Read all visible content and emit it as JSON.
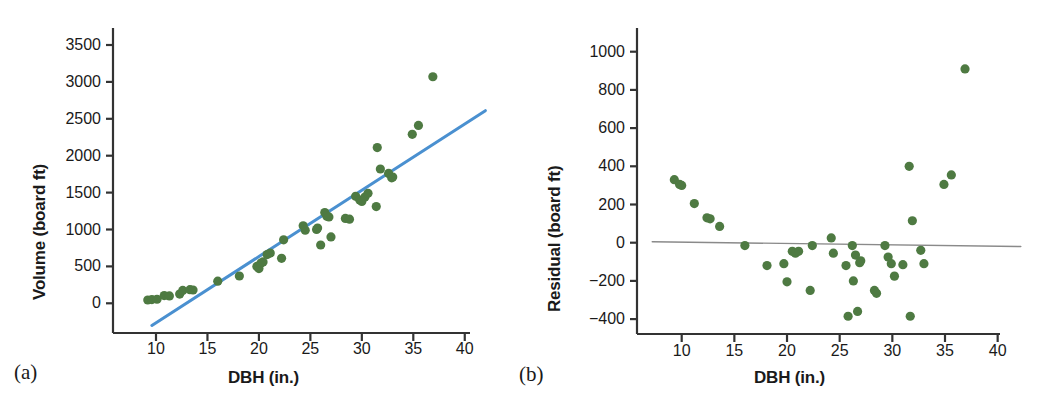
{
  "figure": {
    "panels": [
      {
        "tag": "(a)",
        "xlabel": "DBH (in.)",
        "ylabel": "Volume (board ft)"
      },
      {
        "tag": "(b)",
        "xlabel": "DBH (in.)",
        "ylabel": "Residual (board ft)"
      }
    ],
    "colors": {
      "marker": "#4e7a42",
      "regression_line": "#4a90d0",
      "zero_line": "#8a8a8a",
      "axis": "#333333",
      "text": "#1a1a1a",
      "background": "#ffffff"
    }
  },
  "chart_data": [
    {
      "type": "scatter",
      "panel": "(a)",
      "title": "",
      "xlabel": "DBH (in.)",
      "ylabel": "Volume (board ft)",
      "xlim": [
        7.2,
        42.2
      ],
      "ylim": [
        -330,
        3750
      ],
      "xticks": [
        10,
        15,
        20,
        25,
        30,
        35,
        40
      ],
      "yticks": [
        0,
        500,
        1000,
        1500,
        2000,
        2500,
        3000,
        3500
      ],
      "grid": false,
      "legend": "none",
      "series": [
        {
          "name": "Trees",
          "marker": "circle",
          "color": "#4e7a42",
          "points": [
            [
              9.2,
              45
            ],
            [
              9.6,
              50
            ],
            [
              10.1,
              55
            ],
            [
              10.8,
              105
            ],
            [
              11.3,
              100
            ],
            [
              12.3,
              125
            ],
            [
              12.6,
              175
            ],
            [
              13.3,
              185
            ],
            [
              13.6,
              180
            ],
            [
              16.0,
              300
            ],
            [
              18.1,
              370
            ],
            [
              19.8,
              500
            ],
            [
              20.0,
              470
            ],
            [
              20.2,
              545
            ],
            [
              20.4,
              560
            ],
            [
              20.8,
              660
            ],
            [
              21.1,
              680
            ],
            [
              22.2,
              610
            ],
            [
              22.4,
              860
            ],
            [
              24.3,
              1050
            ],
            [
              24.5,
              990
            ],
            [
              25.6,
              1000
            ],
            [
              25.7,
              1020
            ],
            [
              26.0,
              790
            ],
            [
              26.4,
              1230
            ],
            [
              26.6,
              1180
            ],
            [
              26.8,
              1170
            ],
            [
              27.0,
              900
            ],
            [
              28.4,
              1150
            ],
            [
              28.8,
              1140
            ],
            [
              29.4,
              1450
            ],
            [
              29.8,
              1400
            ],
            [
              30.0,
              1380
            ],
            [
              30.3,
              1440
            ],
            [
              30.6,
              1490
            ],
            [
              31.4,
              1310
            ],
            [
              31.5,
              2110
            ],
            [
              31.8,
              1820
            ],
            [
              32.6,
              1760
            ],
            [
              32.9,
              1700
            ],
            [
              33.0,
              1710
            ],
            [
              34.9,
              2290
            ],
            [
              35.5,
              2410
            ],
            [
              36.9,
              3070
            ]
          ]
        }
      ],
      "annotations": [
        {
          "type": "line",
          "name": "least-squares-regression-line",
          "color": "#4a90d0",
          "from": [
            9.6,
            -300
          ],
          "to": [
            42.0,
            2610
          ]
        }
      ]
    },
    {
      "type": "scatter",
      "panel": "(b)",
      "title": "",
      "xlabel": "DBH (in.)",
      "ylabel": "Residual (board ft)",
      "xlim": [
        7.2,
        42.2
      ],
      "ylim": [
        -520,
        1140
      ],
      "xticks": [
        10,
        15,
        20,
        25,
        30,
        35,
        40
      ],
      "yticks": [
        -400,
        -200,
        0,
        200,
        400,
        600,
        800,
        1000
      ],
      "grid": false,
      "legend": "none",
      "series": [
        {
          "name": "Residuals",
          "marker": "circle",
          "color": "#4e7a42",
          "points": [
            [
              9.3,
              330
            ],
            [
              9.8,
              305
            ],
            [
              10.0,
              300
            ],
            [
              11.2,
              205
            ],
            [
              12.4,
              130
            ],
            [
              12.7,
              125
            ],
            [
              13.6,
              85
            ],
            [
              16.0,
              -15
            ],
            [
              18.1,
              -120
            ],
            [
              19.7,
              -110
            ],
            [
              20.0,
              -205
            ],
            [
              20.5,
              -45
            ],
            [
              20.8,
              -55
            ],
            [
              21.1,
              -45
            ],
            [
              22.2,
              -250
            ],
            [
              22.4,
              -15
            ],
            [
              24.2,
              25
            ],
            [
              24.4,
              -55
            ],
            [
              25.6,
              -120
            ],
            [
              25.8,
              -385
            ],
            [
              26.2,
              -15
            ],
            [
              26.3,
              -200
            ],
            [
              26.5,
              -65
            ],
            [
              26.7,
              -360
            ],
            [
              26.9,
              -105
            ],
            [
              27.0,
              -95
            ],
            [
              28.3,
              -250
            ],
            [
              28.5,
              -265
            ],
            [
              29.3,
              -15
            ],
            [
              29.6,
              -75
            ],
            [
              29.9,
              -110
            ],
            [
              30.2,
              -175
            ],
            [
              31.0,
              -115
            ],
            [
              31.6,
              400
            ],
            [
              31.7,
              -385
            ],
            [
              31.9,
              115
            ],
            [
              32.7,
              -40
            ],
            [
              33.0,
              -110
            ],
            [
              34.9,
              305
            ],
            [
              35.6,
              355
            ],
            [
              36.9,
              910
            ]
          ]
        }
      ],
      "annotations": [
        {
          "type": "line",
          "name": "zero-residual-line",
          "color": "#8a8a8a",
          "from": [
            7.2,
            5
          ],
          "to": [
            42.2,
            -20
          ]
        }
      ]
    }
  ]
}
